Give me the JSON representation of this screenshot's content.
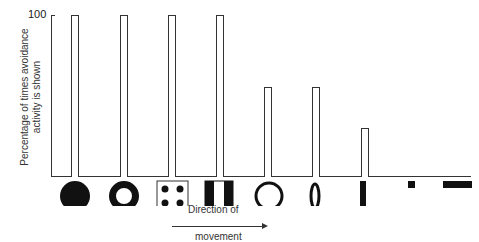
{
  "chart_data": {
    "type": "bar",
    "title": "",
    "xlabel": "Direction of movement",
    "ylabel": "Percentage of times avoidance activity is shown",
    "ylim": [
      0,
      100
    ],
    "yticks": [
      100
    ],
    "categories": [
      "filled disc",
      "ring (thick)",
      "square with four dots",
      "rectangle with black sides",
      "ring (thin)",
      "vertical ellipse ring",
      "vertical bar",
      "small square",
      "horizontal bar"
    ],
    "values": [
      100,
      100,
      100,
      100,
      55,
      55,
      30,
      0,
      0
    ],
    "grid": false
  },
  "labels": {
    "y_tick_100": "100",
    "y_axis": "Percentage of times avoidance activity is shown",
    "direction": "Direction of",
    "movement": "movement"
  }
}
